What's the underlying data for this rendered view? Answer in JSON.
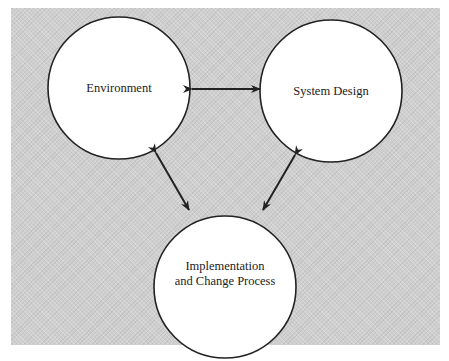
{
  "diagram": {
    "nodes": [
      {
        "id": "environment",
        "label": "Environment"
      },
      {
        "id": "system_design",
        "label": "System Design"
      },
      {
        "id": "implementation",
        "line1": "Implementation",
        "line2": "and Change Process"
      }
    ],
    "edges": [
      {
        "from": "environment",
        "to": "system_design",
        "type": "bidirectional"
      },
      {
        "from": "environment",
        "to": "implementation",
        "type": "bidirectional"
      },
      {
        "from": "system_design",
        "to": "implementation",
        "type": "bidirectional"
      }
    ],
    "colors": {
      "background": "#cfcfcf",
      "node_fill": "#ffffff",
      "stroke": "#222222"
    }
  }
}
